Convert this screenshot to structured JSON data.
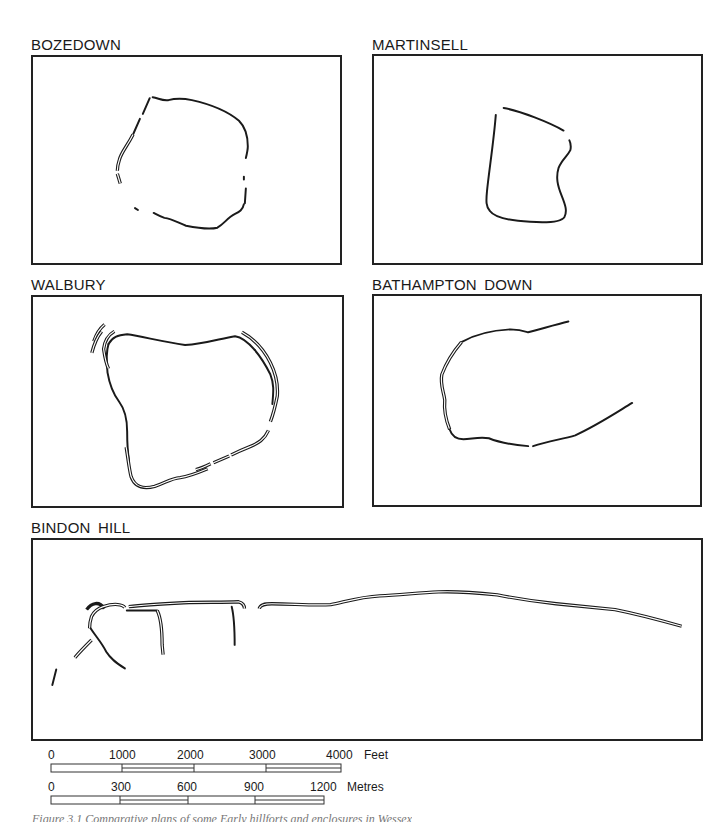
{
  "figure": {
    "panels": [
      {
        "id": "bozedown",
        "label": "BOZEDOWN"
      },
      {
        "id": "martinsell",
        "label": "MARTINSELL"
      },
      {
        "id": "walbury",
        "label": "WALBURY"
      },
      {
        "id": "bathampton",
        "label": "BATHAMPTON  DOWN"
      },
      {
        "id": "bindon",
        "label": "BINDON  HILL"
      }
    ],
    "scale_feet": {
      "unit": "Feet",
      "ticks": [
        "0",
        "1000",
        "2000",
        "3000",
        "4000"
      ]
    },
    "scale_metres": {
      "unit": "Metres",
      "ticks": [
        "0",
        "300",
        "600",
        "900",
        "1200"
      ]
    },
    "caption": "Figure 3.1  Comparative plans of some Early hillforts and enclosures in Wessex"
  },
  "colors": {
    "ink": "#1a1a1a",
    "background": "#ffffff"
  }
}
